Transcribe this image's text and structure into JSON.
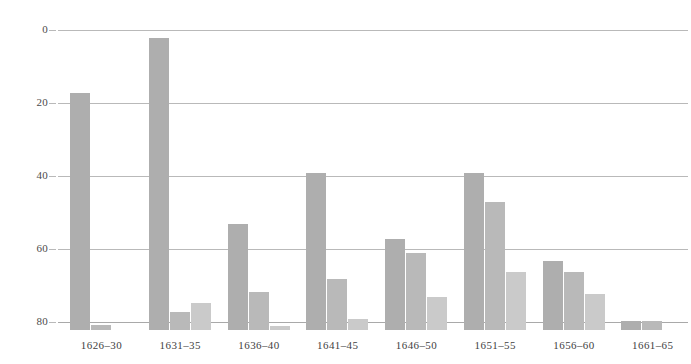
{
  "chart_data": {
    "type": "bar",
    "title": "",
    "subtitle": "",
    "xlabel": "",
    "ylabel": "",
    "categories": [
      "1626–30",
      "1631–35",
      "1636–40",
      "1641–45",
      "1646–50",
      "1651–55",
      "1656–60",
      "1661–65"
    ],
    "series": [
      {
        "name": "series-1",
        "color": "#aeaeae",
        "values": [
          65,
          80,
          29,
          43,
          25,
          43,
          19,
          2.5
        ]
      },
      {
        "name": "series-2",
        "color": "#b9b9b9",
        "values": [
          1.5,
          5,
          10.5,
          14,
          21,
          35,
          16,
          2.5
        ]
      },
      {
        "name": "series-3",
        "color": "#cacaca",
        "values": [
          0,
          7.5,
          1,
          3,
          9,
          16,
          10,
          0
        ]
      }
    ],
    "ylim": [
      0,
      80
    ],
    "yticks": [
      0,
      20,
      40,
      60,
      80
    ],
    "ytick_labels": [
      "0",
      "20",
      "40",
      "60",
      "80"
    ],
    "grid": true,
    "legend": "none"
  },
  "axis": {
    "y_ticks": [
      {
        "label": "80",
        "value": 80
      },
      {
        "label": "60",
        "value": 60
      },
      {
        "label": "40",
        "value": 40
      },
      {
        "label": "20",
        "value": 20
      },
      {
        "label": "0",
        "value": 0
      }
    ]
  },
  "colors": {
    "series_1": "#aeaeae",
    "series_2": "#b9b9b9",
    "series_3": "#cacaca",
    "gridline": "#b9b9b9",
    "text": "#3f3f3f",
    "background": "#ffffff"
  }
}
